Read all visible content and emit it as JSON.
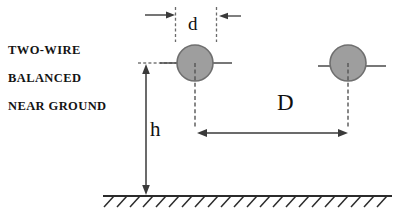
{
  "figure": {
    "title_lines": [
      {
        "text": "TWO-WIRE"
      },
      {
        "text": "BALANCED"
      },
      {
        "text": "NEAR  GROUND"
      }
    ],
    "labels": {
      "conductor_diameter": "d",
      "conductor_separation": "D",
      "height_above_ground": "h"
    },
    "colors": {
      "conductor_fill": "#9e9e9e",
      "conductor_stroke": "#707070",
      "line": "#3a3a3a",
      "ground": "#2b2b2b",
      "text": "#121212",
      "background": "#ffffff"
    },
    "geometry": {
      "left_conductor": {
        "cx": 195,
        "cy": 63,
        "r": 18
      },
      "right_conductor": {
        "cx": 348,
        "cy": 63,
        "r": 18
      },
      "ground_line_y": 196,
      "ground_line_x_start": 103,
      "ground_line_x_end": 392,
      "d_dimension": {
        "x_left": 175,
        "x_right": 215,
        "y": 22
      },
      "D_dimension": {
        "x_left": 198,
        "x_right": 347,
        "y": 133
      },
      "h_dimension": {
        "x": 146,
        "y_top": 65,
        "y_bottom": 194
      }
    },
    "icon_names": {
      "conductor": "filled-circle-conductor-icon",
      "ground": "ground-hatch-icon",
      "arrow": "dimension-arrow-icon"
    }
  }
}
